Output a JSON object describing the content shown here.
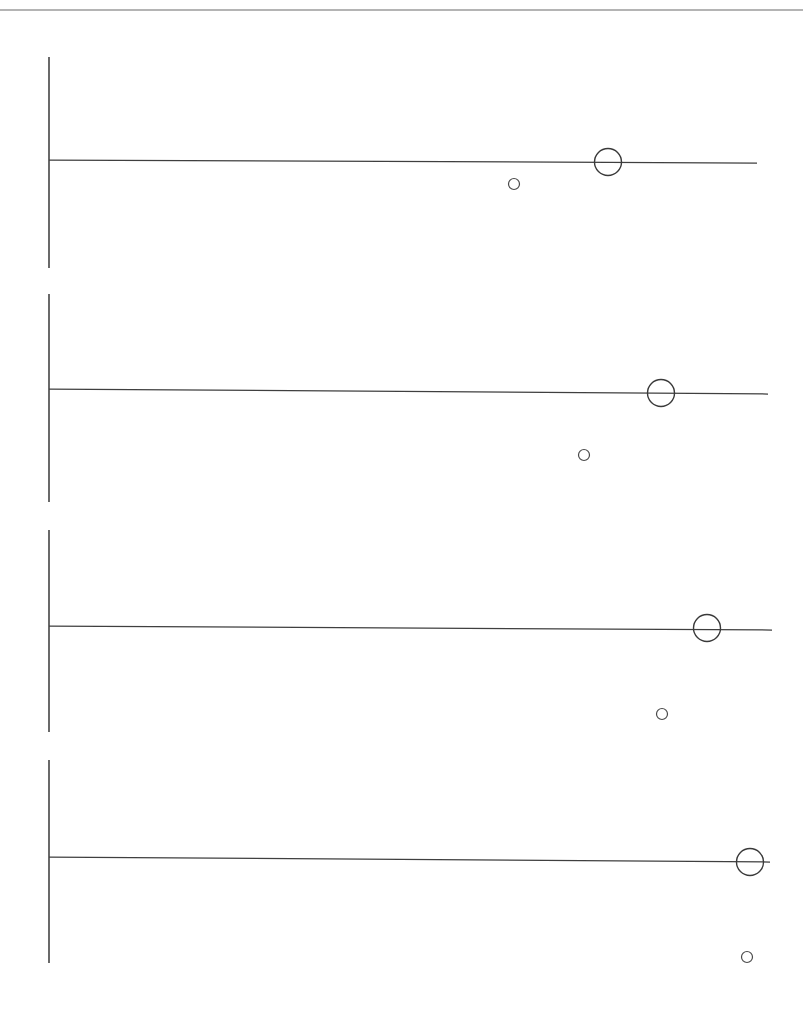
{
  "page": {
    "width": 803,
    "height": 1020,
    "background": "#ffffff",
    "ink_color": "#3a3a3a",
    "rule_color": "#6a6a6a"
  },
  "header_rule": {
    "name": "top-scan-rule",
    "x1": 0,
    "x2": 803,
    "y": 10
  },
  "chart_data": {
    "type": "scatter",
    "title": "",
    "subtitle": "",
    "xlabel": "",
    "ylabel": "",
    "grid": false,
    "legend": "none",
    "axis_origin_x": 49,
    "xlim": [
      49,
      780
    ],
    "panels": [
      {
        "id": "panel-1",
        "label": "",
        "axis_x": 49,
        "axis_y_top": 57,
        "axis_y_bottom": 268,
        "range_line": {
          "x1": 49,
          "x2": 757,
          "y": 160,
          "y2": 163
        },
        "markers": [
          {
            "name": "large-circle",
            "cx": 608,
            "cy": 162,
            "r": 13.5,
            "size": "large"
          },
          {
            "name": "small-circle",
            "cx": 514,
            "cy": 184,
            "r": 5.5,
            "size": "small"
          }
        ]
      },
      {
        "id": "panel-2",
        "label": "",
        "axis_x": 49,
        "axis_y_top": 294,
        "axis_y_bottom": 502,
        "range_line": {
          "x1": 49,
          "x2": 768,
          "y": 389,
          "y2": 394
        },
        "markers": [
          {
            "name": "large-circle",
            "cx": 661,
            "cy": 393,
            "r": 13.5,
            "size": "large"
          },
          {
            "name": "small-circle",
            "cx": 584,
            "cy": 455,
            "r": 5.5,
            "size": "small"
          }
        ]
      },
      {
        "id": "panel-3",
        "label": "",
        "axis_x": 49,
        "axis_y_top": 530,
        "axis_y_bottom": 732,
        "range_line": {
          "x1": 49,
          "x2": 772,
          "y": 626,
          "y2": 630
        },
        "markers": [
          {
            "name": "large-circle",
            "cx": 707,
            "cy": 628,
            "r": 13.5,
            "size": "large"
          },
          {
            "name": "small-circle",
            "cx": 662,
            "cy": 714,
            "r": 5.5,
            "size": "small"
          }
        ]
      },
      {
        "id": "panel-4",
        "label": "",
        "axis_x": 49,
        "axis_y_top": 760,
        "axis_y_bottom": 963,
        "range_line": {
          "x1": 49,
          "x2": 770,
          "y": 857,
          "y2": 862
        },
        "markers": [
          {
            "name": "large-circle",
            "cx": 750,
            "cy": 862,
            "r": 13.5,
            "size": "large"
          },
          {
            "name": "small-circle",
            "cx": 747,
            "cy": 957,
            "r": 5.5,
            "size": "small"
          }
        ]
      }
    ]
  }
}
